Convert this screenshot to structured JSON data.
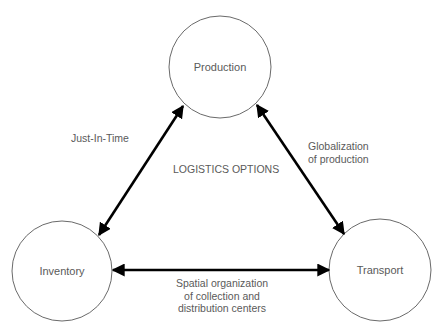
{
  "title": "LOGISTICS OPTIONS",
  "nodes": {
    "production": {
      "label": "Production",
      "cx": 220,
      "cy": 67,
      "r": 51
    },
    "inventory": {
      "label": "Inventory",
      "cx": 62,
      "cy": 271,
      "r": 50
    },
    "transport": {
      "label": "Transport",
      "cx": 380,
      "cy": 270,
      "r": 51
    }
  },
  "edges": {
    "production_inventory": {
      "label": "Just-In-Time",
      "from": "production",
      "to": "inventory",
      "bidirectional": true
    },
    "production_transport": {
      "label": "Globalization\nof production",
      "from": "production",
      "to": "transport",
      "bidirectional": true
    },
    "inventory_transport": {
      "label": "Spatial organization\nof collection and\ndistribution centers",
      "from": "inventory",
      "to": "transport",
      "bidirectional": true
    }
  },
  "colors": {
    "circle_stroke": "#6a6a6a",
    "arrow": "#000000",
    "text": "#5a5a5a"
  }
}
